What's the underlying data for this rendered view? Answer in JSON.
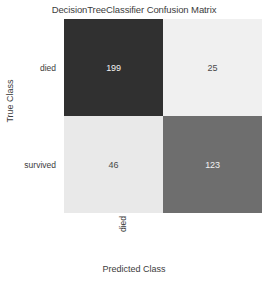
{
  "chart_data": {
    "type": "heatmap",
    "title": "DecisionTreeClassifier Confusion Matrix",
    "xlabel": "Predicted Class",
    "ylabel": "True Class",
    "x_categories": [
      "died",
      "survived"
    ],
    "y_categories": [
      "died",
      "survived"
    ],
    "grid": false,
    "legend": "none",
    "colormap": "greys-inverted",
    "cells": [
      {
        "row": "died",
        "col": "died",
        "value": "199",
        "kind": "true-negative",
        "fill": "#303030",
        "text_color": "#f2f2f2"
      },
      {
        "row": "died",
        "col": "survived",
        "value": "25",
        "kind": "false-positive",
        "fill": "#f0f0f0",
        "text_color": "#4a4a4a"
      },
      {
        "row": "survived",
        "col": "died",
        "value": "46",
        "kind": "false-negative",
        "fill": "#e9e9e9",
        "text_color": "#4a4a4a"
      },
      {
        "row": "survived",
        "col": "survived",
        "value": "123",
        "kind": "true-positive",
        "fill": "#6e6e6e",
        "text_color": "#f2f2f2"
      }
    ],
    "matrix": [
      [
        199,
        25
      ],
      [
        46,
        123
      ]
    ]
  }
}
